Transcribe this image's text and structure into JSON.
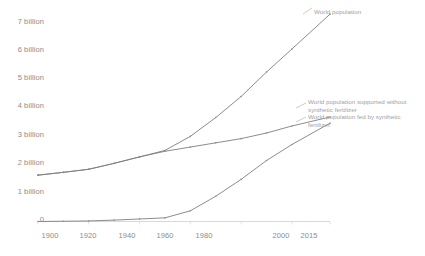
{
  "chart_data": {
    "type": "line",
    "title": "",
    "xlabel": "",
    "ylabel": "",
    "xlim": [
      1900,
      2015
    ],
    "ylim": [
      0,
      7.6
    ],
    "grid": false,
    "legend_position": "line-end-annotations",
    "x_ticks": [
      "1900",
      "1920",
      "1940",
      "1960",
      "1980",
      "2000",
      "2015"
    ],
    "y_ticks": [
      "0",
      "1 billion",
      "2 billion",
      "3 billion",
      "4 billion",
      "5 billion",
      "6 billion",
      "7 billion"
    ],
    "x": [
      1900,
      1910,
      1920,
      1930,
      1940,
      1950,
      1960,
      1970,
      1980,
      1990,
      2000,
      2015
    ],
    "series": [
      {
        "name": "World population",
        "color": "#7f7f7f",
        "values": [
          1.65,
          1.75,
          1.86,
          2.07,
          2.3,
          2.53,
          3.03,
          3.7,
          4.45,
          5.32,
          6.14,
          7.38
        ]
      },
      {
        "name": "World population supported without synthetic fertilizer",
        "color": "#7f7f7f",
        "values": [
          1.65,
          1.75,
          1.86,
          2.07,
          2.3,
          2.5,
          2.65,
          2.8,
          2.95,
          3.15,
          3.4,
          3.72
        ]
      },
      {
        "name": "World population fed by synthetic fertilizer",
        "color": "#7f7f7f",
        "values": [
          0.0,
          0.01,
          0.02,
          0.05,
          0.09,
          0.13,
          0.38,
          0.9,
          1.5,
          2.17,
          2.74,
          3.5
        ]
      }
    ],
    "annotations": [
      {
        "id": "world-population",
        "text": "World population"
      },
      {
        "id": "supported-without-fertilizer",
        "text": "World population supported without synthetic fertilizer"
      },
      {
        "id": "fed-by-fertilizer",
        "text": "World population fed by synthetic fertilizer"
      }
    ]
  },
  "axis": {
    "y_labels": [
      {
        "text": "7 billion",
        "top": 17
      },
      {
        "text": "6 billion",
        "top": 45
      },
      {
        "text": "5 billion",
        "top": 73
      },
      {
        "text": "4 billion",
        "top": 101
      },
      {
        "text": "3 billion",
        "top": 130
      },
      {
        "text": "2 billion",
        "top": 158
      },
      {
        "text": "1 billion",
        "top": 187
      },
      {
        "text": "0",
        "top": 215
      }
    ],
    "x_labels": [
      {
        "text": "1900",
        "left": 50
      },
      {
        "text": "1920",
        "left": 88
      },
      {
        "text": "1940",
        "left": 127
      },
      {
        "text": "1960",
        "left": 165
      },
      {
        "text": "1980",
        "left": 204
      },
      {
        "text": "2000",
        "left": 281
      },
      {
        "text": "2015",
        "left": 309
      }
    ]
  },
  "labels": {
    "world_population": "World population",
    "supported_without_line1": "World population supported without",
    "supported_without_line2": "synthetic fertilizer",
    "fed_by_line1": "World population fed by synthetic",
    "fed_by_line2": "fertilizer"
  }
}
